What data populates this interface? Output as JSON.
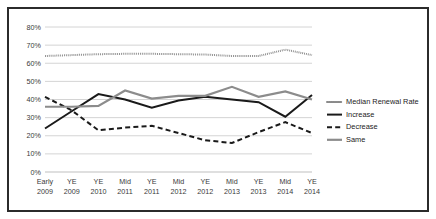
{
  "chart_data": {
    "type": "line",
    "title": "",
    "xlabel": "",
    "ylabel": "",
    "ylim": [
      0,
      80
    ],
    "ytick_step": 10,
    "grid": true,
    "legend_position": "right",
    "categories": [
      "Early 2009",
      "YE 2009",
      "YE 2010",
      "Mid 2011",
      "YE 2011",
      "Mid 2012",
      "YE 2012",
      "Mid 2013",
      "YE 2013",
      "Mid 2014",
      "YE 2014"
    ],
    "category_lines": [
      [
        "Early",
        "2009"
      ],
      [
        "YE",
        "2009"
      ],
      [
        "YE",
        "2010"
      ],
      [
        "Mid",
        "2011"
      ],
      [
        "YE",
        "2011"
      ],
      [
        "Mid",
        "2012"
      ],
      [
        "YE",
        "2012"
      ],
      [
        "Mid",
        "2013"
      ],
      [
        "YE",
        "2013"
      ],
      [
        "Mid",
        "2014"
      ],
      [
        "YE",
        "2014"
      ]
    ],
    "ytick_labels": [
      "0%",
      "10%",
      "20%",
      "30%",
      "40%",
      "50%",
      "60%",
      "70%",
      "80%"
    ],
    "ytick_values": [
      0,
      10,
      20,
      30,
      40,
      50,
      60,
      70,
      80
    ],
    "series": [
      {
        "name": "Median Renewal Rate",
        "style": "dotted",
        "color": "#8a8a8a",
        "values": [
          64.0,
          64.5,
          65.0,
          65.2,
          65.2,
          65.0,
          64.8,
          64.0,
          64.0,
          67.5,
          64.5
        ]
      },
      {
        "name": "Increase",
        "style": "solid",
        "color": "#1a1a1a",
        "values": [
          24.0,
          33.5,
          43.0,
          40.0,
          35.5,
          39.5,
          41.5,
          40.0,
          38.5,
          30.5,
          42.5
        ]
      },
      {
        "name": "Decrease",
        "style": "dashed",
        "color": "#1a1a1a",
        "values": [
          41.5,
          34.0,
          23.0,
          24.5,
          25.5,
          21.5,
          17.5,
          16.0,
          22.0,
          27.5,
          21.5
        ]
      },
      {
        "name": "Same",
        "style": "solid",
        "color": "#8c8c8c",
        "values": [
          36.0,
          36.0,
          36.5,
          45.0,
          40.5,
          42.0,
          42.0,
          47.0,
          41.5,
          44.5,
          40.0
        ]
      }
    ]
  },
  "legend": {
    "items": [
      {
        "label": "Median Renewal Rate"
      },
      {
        "label": "Increase"
      },
      {
        "label": "Decrease"
      },
      {
        "label": "Same"
      }
    ]
  }
}
